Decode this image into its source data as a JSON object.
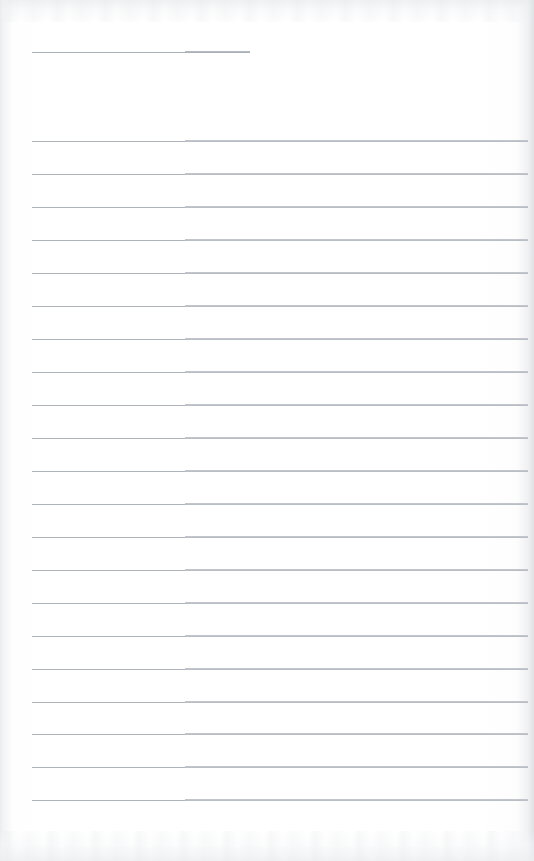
{
  "document": {
    "kind": "blank-lined-notebook-page",
    "title": "",
    "body_text": "",
    "page_width": 534,
    "page_height": 861,
    "background_color": "#fdfdfd",
    "rule_color": "#b9bdc4",
    "rule_color_left_segment": "#aeb3bb",
    "rule_color_right_segment": "#c2c6cc",
    "edge_shadow_color": "#dde0e4"
  },
  "header_rule": {
    "label": "header-rule",
    "x_start": 32,
    "x_end": 250,
    "y": 52,
    "fold_x": 185,
    "color": "#aab0b8"
  },
  "ruled_area": {
    "label": "ruled-writing-area",
    "x_start": 32,
    "x_end": 528,
    "first_line_y": 141,
    "line_spacing": 33,
    "line_count": 21,
    "fold_x": 185,
    "lines": [
      {
        "index": 1,
        "y": 141
      },
      {
        "index": 2,
        "y": 174
      },
      {
        "index": 3,
        "y": 207
      },
      {
        "index": 4,
        "y": 240
      },
      {
        "index": 5,
        "y": 273
      },
      {
        "index": 6,
        "y": 306
      },
      {
        "index": 7,
        "y": 339
      },
      {
        "index": 8,
        "y": 372
      },
      {
        "index": 9,
        "y": 405
      },
      {
        "index": 10,
        "y": 438
      },
      {
        "index": 11,
        "y": 471
      },
      {
        "index": 12,
        "y": 504
      },
      {
        "index": 13,
        "y": 537
      },
      {
        "index": 14,
        "y": 570
      },
      {
        "index": 15,
        "y": 603
      },
      {
        "index": 16,
        "y": 636
      },
      {
        "index": 17,
        "y": 669
      },
      {
        "index": 18,
        "y": 702
      },
      {
        "index": 19,
        "y": 734
      },
      {
        "index": 20,
        "y": 767
      },
      {
        "index": 21,
        "y": 800
      }
    ]
  },
  "scan_artifacts": {
    "top_band_height": 22,
    "bottom_band_height": 30,
    "right_edge_width": 16,
    "left_edge_width": 12
  }
}
